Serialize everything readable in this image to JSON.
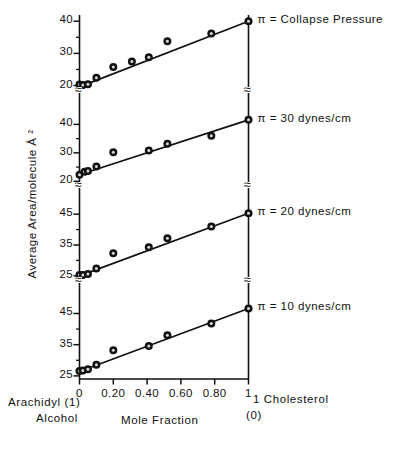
{
  "figure": {
    "ylabel": "Average Area/molecule Å ²",
    "xlabel": "Mole Fraction",
    "left_corner_line1": "Arachidyl (1)",
    "left_corner_line2": "Alcohol",
    "right_corner_line1": "1 Cholesterol",
    "right_corner_line2": "(0)",
    "break_symbol": "≈"
  },
  "chart_data": {
    "type": "scatter",
    "title": "",
    "xlabel": "Mole Fraction",
    "ylabel": "Average Area/molecule Å ²",
    "xlim": [
      0,
      1
    ],
    "xticks": [
      0,
      0.2,
      0.4,
      0.6,
      0.8,
      1
    ],
    "xticklabels": [
      "0",
      "0.20",
      "0.40",
      "0.60",
      "0.80",
      "1"
    ],
    "grid": false,
    "legend": "right-of-axis panel labels",
    "axis_note": "Four stacked panels sharing one x axis; y axis is broken between panels",
    "panels": [
      {
        "label": "π = Collapse Pressure",
        "yticks": [
          20,
          30,
          40
        ],
        "ylim": [
          18,
          41
        ],
        "points_x": [
          0.0,
          0.02,
          0.05,
          0.1,
          0.2,
          0.31,
          0.41,
          0.52,
          0.78,
          1.0
        ],
        "points_y": [
          20.3,
          20.2,
          20.4,
          22.4,
          25.8,
          27.5,
          28.8,
          33.8,
          36.2,
          40.0
        ],
        "fit_line": {
          "x": [
            0.0,
            1.0
          ],
          "y": [
            19.6,
            40.0
          ]
        }
      },
      {
        "label": "π = 30 dynes/cm",
        "yticks": [
          20,
          30,
          40
        ],
        "ylim": [
          18,
          44
        ],
        "points_x": [
          0.0,
          0.03,
          0.05,
          0.1,
          0.2,
          0.41,
          0.52,
          0.78,
          1.0
        ],
        "points_y": [
          22.3,
          23.4,
          23.6,
          25.2,
          30.2,
          30.8,
          33.2,
          36.0,
          41.6
        ],
        "fit_line": {
          "x": [
            0.0,
            1.0
          ],
          "y": [
            22.3,
            41.6
          ]
        }
      },
      {
        "label": "π = 20 dynes/cm",
        "yticks": [
          25,
          35,
          45
        ],
        "ylim": [
          23,
          47
        ],
        "points_x": [
          0.0,
          0.02,
          0.05,
          0.1,
          0.2,
          0.41,
          0.52,
          0.78,
          1.0
        ],
        "points_y": [
          25.3,
          25.3,
          25.6,
          27.4,
          32.3,
          34.3,
          37.2,
          41.0,
          45.3
        ],
        "fit_line": {
          "x": [
            0.0,
            1.0
          ],
          "y": [
            25.0,
            45.3
          ]
        }
      },
      {
        "label": "π = 10 dynes/cm",
        "yticks": [
          25,
          35,
          45
        ],
        "ylim": [
          24,
          49
        ],
        "points_x": [
          0.0,
          0.02,
          0.05,
          0.1,
          0.2,
          0.41,
          0.52,
          0.78,
          1.0
        ],
        "points_y": [
          26.6,
          26.7,
          27.1,
          28.6,
          33.2,
          34.6,
          38.0,
          41.8,
          46.6
        ],
        "fit_line": {
          "x": [
            0.0,
            1.0
          ],
          "y": [
            26.4,
            46.6
          ]
        }
      }
    ]
  }
}
